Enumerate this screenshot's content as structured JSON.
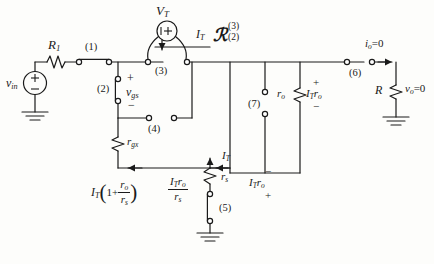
{
  "figure": {
    "type": "small-signal-circuit-schematic"
  },
  "sources": {
    "input": {
      "label": "v",
      "sub": "in",
      "plus": "+",
      "minus": "−"
    },
    "test": {
      "label": "V",
      "sub": "T",
      "polarity": "+",
      "current_label": "I",
      "current_sub": "T"
    }
  },
  "components": {
    "r1": {
      "label": "R",
      "sub": "1"
    },
    "rgx": {
      "label": "r",
      "sub": "gx"
    },
    "rs": {
      "label": "r",
      "sub": "s"
    },
    "ro": {
      "label": "r",
      "sub": "o"
    },
    "rload": {
      "label": "R"
    }
  },
  "nodes": [
    {
      "id": "1",
      "label": "(1)"
    },
    {
      "id": "2",
      "label": "(2)"
    },
    {
      "id": "3",
      "label": "(3)"
    },
    {
      "id": "4",
      "label": "(4)"
    },
    {
      "id": "5",
      "label": "(5)"
    },
    {
      "id": "6",
      "label": "(6)"
    },
    {
      "id": "7",
      "label": "(7)"
    }
  ],
  "labels": {
    "vgs": {
      "base": "v",
      "sub": "gs",
      "plus": "+",
      "minus": "−"
    },
    "resistance_symbol": {
      "glyph": "ℛ",
      "sup": "(3)",
      "sub": "(2)"
    },
    "io_zero": {
      "base": "i",
      "sub": "o",
      "eq": "=0"
    },
    "vo_zero": {
      "base": "v",
      "sub": "o",
      "eq": "=0"
    },
    "it_ro_source": {
      "base": "I",
      "sub": "T",
      "base2": "r",
      "sub2": "o",
      "plus": "+",
      "minus": "−"
    },
    "it_ro_drop": {
      "base": "I",
      "sub": "T",
      "base2": "r",
      "sub2": "o",
      "plus": "+",
      "minus": "−"
    },
    "it_branch": {
      "base": "I",
      "sub": "T"
    },
    "it_current_top": {
      "base": "I",
      "sub": "T"
    },
    "it_total": {
      "base": "I",
      "sub": "T",
      "open": "(",
      "one": "1+",
      "frac_num_base": "r",
      "frac_num_sub": "o",
      "frac_den_base": "r",
      "frac_den_sub": "s",
      "close": ")"
    },
    "it_ro_over_rs": {
      "num_base": "I",
      "num_sub": "T",
      "num_base2": "r",
      "num_sub2": "o",
      "den_base": "r",
      "den_sub": "s"
    }
  },
  "colors": {
    "wire": "#1a1a1a",
    "background": "#fdfdfb",
    "text": "#1a1a1a"
  }
}
